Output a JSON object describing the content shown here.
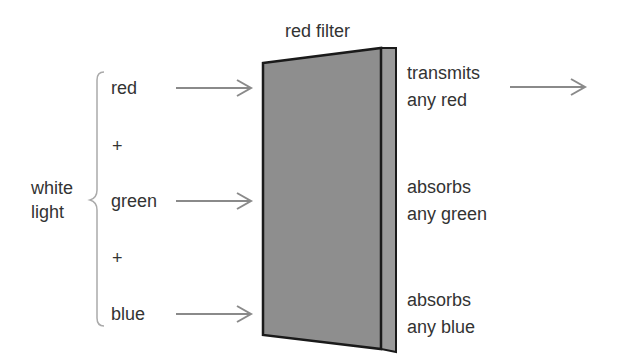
{
  "title": "red filter",
  "source_label": {
    "line1": "white",
    "line2": "light"
  },
  "inputs": [
    {
      "label": "red"
    },
    {
      "label": "+"
    },
    {
      "label": "green"
    },
    {
      "label": "+"
    },
    {
      "label": "blue"
    }
  ],
  "outputs": [
    {
      "line1": "transmits",
      "line2": "any red",
      "arrow_out": true
    },
    {
      "line1": "absorbs",
      "line2": "any green",
      "arrow_out": false
    },
    {
      "line1": "absorbs",
      "line2": "any blue",
      "arrow_out": false
    }
  ],
  "colors": {
    "filter_fill": "#8e8e8e",
    "filter_edge": "#1a1a1a",
    "arrow": "#8a8a8a",
    "brace": "#aaaaaa",
    "text": "#333333"
  }
}
